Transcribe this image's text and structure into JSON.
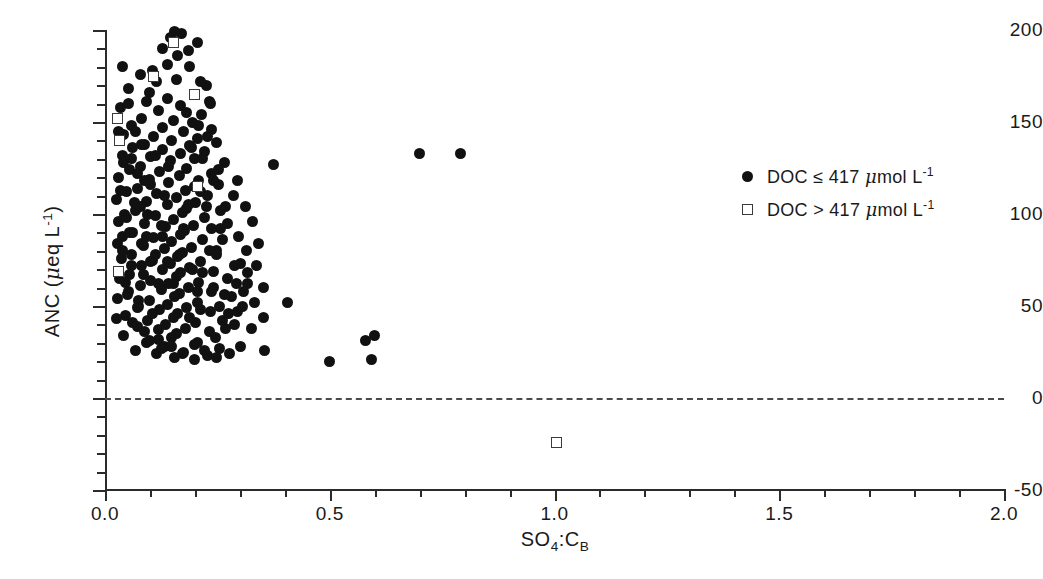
{
  "chart_data": {
    "type": "scatter",
    "title": "",
    "xlabel": "SO4:CB",
    "ylabel": "ANC (ueq L-1)",
    "xlim": [
      0.0,
      2.0
    ],
    "ylim": [
      -50,
      200
    ],
    "grid": false,
    "legend_position": "right",
    "xticks": [
      0.0,
      0.5,
      1.0,
      1.5,
      2.0
    ],
    "xtick_labels": [
      "0.0",
      "0.5",
      "1.0",
      "1.5",
      "2.0"
    ],
    "x_minor_step": 0.1,
    "yticks": [
      -50,
      0,
      50,
      100,
      150,
      200
    ],
    "ytick_labels": [
      "-50",
      "0",
      "50",
      "100",
      "150",
      "200"
    ],
    "y_minor_step": 10,
    "annotations": [
      {
        "name": "zero-reference-line",
        "type": "hline",
        "y": 0,
        "style": "dashed"
      }
    ],
    "series": [
      {
        "name": "DOC <= 417 umol L-1",
        "marker": "filled-circle",
        "color": "#111111",
        "points": [
          [
            0.155,
            199
          ],
          [
            0.17,
            198
          ],
          [
            0.145,
            196
          ],
          [
            0.205,
            193
          ],
          [
            0.128,
            190
          ],
          [
            0.185,
            189
          ],
          [
            0.04,
            180
          ],
          [
            0.105,
            178
          ],
          [
            0.078,
            176
          ],
          [
            0.16,
            173
          ],
          [
            0.225,
            170
          ],
          [
            0.052,
            168
          ],
          [
            0.098,
            166
          ],
          [
            0.2,
            165
          ],
          [
            0.14,
            163
          ],
          [
            0.232,
            161
          ],
          [
            0.168,
            159
          ],
          [
            0.035,
            158
          ],
          [
            0.118,
            156
          ],
          [
            0.215,
            154
          ],
          [
            0.082,
            152
          ],
          [
            0.152,
            151
          ],
          [
            0.195,
            150
          ],
          [
            0.06,
            148
          ],
          [
            0.128,
            147
          ],
          [
            0.238,
            146
          ],
          [
            0.175,
            145
          ],
          [
            0.042,
            143
          ],
          [
            0.108,
            142
          ],
          [
            0.205,
            141
          ],
          [
            0.148,
            140
          ],
          [
            0.248,
            139
          ],
          [
            0.088,
            138
          ],
          [
            0.188,
            137
          ],
          [
            0.062,
            136
          ],
          [
            0.128,
            135
          ],
          [
            0.222,
            134
          ],
          [
            0.168,
            133
          ],
          [
            0.7,
            133
          ],
          [
            0.79,
            133
          ],
          [
            0.038,
            132
          ],
          [
            0.102,
            131
          ],
          [
            0.198,
            130
          ],
          [
            0.145,
            129
          ],
          [
            0.265,
            128
          ],
          [
            0.375,
            127
          ],
          [
            0.078,
            126
          ],
          [
            0.182,
            125
          ],
          [
            0.055,
            124
          ],
          [
            0.122,
            123
          ],
          [
            0.238,
            122
          ],
          [
            0.165,
            121
          ],
          [
            0.03,
            120
          ],
          [
            0.098,
            119
          ],
          [
            0.208,
            118
          ],
          [
            0.142,
            117
          ],
          [
            0.252,
            116
          ],
          [
            0.198,
            115
          ],
          [
            0.072,
            114
          ],
          [
            0.178,
            113
          ],
          [
            0.048,
            112
          ],
          [
            0.115,
            111
          ],
          [
            0.228,
            110
          ],
          [
            0.158,
            109
          ],
          [
            0.025,
            108
          ],
          [
            0.092,
            107
          ],
          [
            0.202,
            106
          ],
          [
            0.138,
            105
          ],
          [
            0.268,
            104
          ],
          [
            0.182,
            103
          ],
          [
            0.068,
            102
          ],
          [
            0.172,
            101
          ],
          [
            0.044,
            100
          ],
          [
            0.112,
            99
          ],
          [
            0.222,
            98
          ],
          [
            0.152,
            97
          ],
          [
            0.03,
            96
          ],
          [
            0.088,
            95
          ],
          [
            0.196,
            94
          ],
          [
            0.135,
            93
          ],
          [
            0.258,
            92
          ],
          [
            0.176,
            91
          ],
          [
            0.062,
            90
          ],
          [
            0.168,
            89
          ],
          [
            0.04,
            88
          ],
          [
            0.108,
            87
          ],
          [
            0.218,
            86
          ],
          [
            0.148,
            85
          ],
          [
            0.028,
            84
          ],
          [
            0.085,
            83
          ],
          [
            0.192,
            82
          ],
          [
            0.132,
            81
          ],
          [
            0.248,
            80
          ],
          [
            0.172,
            79
          ],
          [
            0.058,
            78
          ],
          [
            0.162,
            77
          ],
          [
            0.036,
            76
          ],
          [
            0.105,
            75
          ],
          [
            0.212,
            74
          ],
          [
            0.145,
            73
          ],
          [
            0.302,
            73
          ],
          [
            0.082,
            72
          ],
          [
            0.188,
            71
          ],
          [
            0.128,
            70
          ],
          [
            0.242,
            69
          ],
          [
            0.168,
            68
          ],
          [
            0.054,
            67
          ],
          [
            0.158,
            66
          ],
          [
            0.032,
            65
          ],
          [
            0.102,
            64
          ],
          [
            0.208,
            63
          ],
          [
            0.142,
            62
          ],
          [
            0.318,
            62
          ],
          [
            0.078,
            61
          ],
          [
            0.185,
            60
          ],
          [
            0.352,
            60
          ],
          [
            0.125,
            59
          ],
          [
            0.238,
            58
          ],
          [
            0.165,
            57
          ],
          [
            0.05,
            56
          ],
          [
            0.155,
            55
          ],
          [
            0.028,
            54
          ],
          [
            0.098,
            53
          ],
          [
            0.205,
            52
          ],
          [
            0.138,
            51
          ],
          [
            0.405,
            52
          ],
          [
            0.075,
            50
          ],
          [
            0.182,
            49
          ],
          [
            0.122,
            48
          ],
          [
            0.235,
            47
          ],
          [
            0.162,
            46
          ],
          [
            0.046,
            45
          ],
          [
            0.152,
            44
          ],
          [
            0.026,
            43
          ],
          [
            0.095,
            42
          ],
          [
            0.202,
            41
          ],
          [
            0.135,
            40
          ],
          [
            0.072,
            39
          ],
          [
            0.178,
            38
          ],
          [
            0.118,
            37
          ],
          [
            0.232,
            36
          ],
          [
            0.158,
            35
          ],
          [
            0.042,
            34
          ],
          [
            0.148,
            33
          ],
          [
            0.6,
            34
          ],
          [
            0.58,
            31
          ],
          [
            0.092,
            30
          ],
          [
            0.198,
            29
          ],
          [
            0.132,
            28
          ],
          [
            0.255,
            27
          ],
          [
            0.068,
            26
          ],
          [
            0.175,
            25
          ],
          [
            0.355,
            26
          ],
          [
            0.115,
            24
          ],
          [
            0.228,
            23
          ],
          [
            0.155,
            22
          ],
          [
            0.5,
            20
          ],
          [
            0.592,
            21
          ],
          [
            0.212,
            48
          ],
          [
            0.188,
            44
          ],
          [
            0.262,
            42
          ],
          [
            0.295,
            47
          ],
          [
            0.282,
            55
          ],
          [
            0.308,
            58
          ],
          [
            0.272,
            65
          ],
          [
            0.288,
            72
          ],
          [
            0.315,
            80
          ],
          [
            0.298,
            88
          ],
          [
            0.272,
            95
          ],
          [
            0.258,
            102
          ],
          [
            0.285,
            110
          ],
          [
            0.242,
            118
          ],
          [
            0.318,
            68
          ],
          [
            0.332,
            52
          ],
          [
            0.268,
            38
          ],
          [
            0.245,
            33
          ],
          [
            0.205,
            30
          ],
          [
            0.118,
            32
          ],
          [
            0.088,
            36
          ],
          [
            0.062,
            41
          ],
          [
            0.105,
            46
          ],
          [
            0.075,
            53
          ],
          [
            0.052,
            58
          ],
          [
            0.118,
            62
          ],
          [
            0.085,
            67
          ],
          [
            0.058,
            72
          ],
          [
            0.112,
            78
          ],
          [
            0.082,
            84
          ],
          [
            0.055,
            90
          ],
          [
            0.125,
            94
          ],
          [
            0.095,
            100
          ],
          [
            0.065,
            106
          ],
          [
            0.132,
            110
          ],
          [
            0.102,
            116
          ],
          [
            0.072,
            122
          ],
          [
            0.142,
            126
          ],
          [
            0.112,
            132
          ],
          [
            0.082,
            138
          ],
          [
            0.262,
            86
          ],
          [
            0.248,
            78
          ],
          [
            0.238,
            92
          ],
          [
            0.225,
            104
          ],
          [
            0.212,
            112
          ],
          [
            0.252,
            124
          ],
          [
            0.218,
            130
          ],
          [
            0.192,
            136
          ],
          [
            0.228,
            142
          ],
          [
            0.208,
            148
          ],
          [
            0.182,
            155
          ],
          [
            0.235,
            160
          ],
          [
            0.212,
            172
          ],
          [
            0.188,
            180
          ],
          [
            0.162,
            186
          ],
          [
            0.138,
            181
          ],
          [
            0.115,
            172
          ],
          [
            0.092,
            161
          ],
          [
            0.328,
            96
          ],
          [
            0.342,
            84
          ],
          [
            0.312,
            104
          ],
          [
            0.295,
            118
          ],
          [
            0.338,
            72
          ],
          [
            0.352,
            44
          ],
          [
            0.325,
            38
          ],
          [
            0.302,
            28
          ],
          [
            0.278,
            24
          ],
          [
            0.248,
            22
          ],
          [
            0.222,
            26
          ],
          [
            0.198,
            21
          ],
          [
            0.172,
            24
          ],
          [
            0.148,
            28
          ],
          [
            0.125,
            27
          ],
          [
            0.098,
            31
          ],
          [
            0.072,
            49
          ],
          [
            0.045,
            63
          ],
          [
            0.038,
            80
          ],
          [
            0.048,
            98
          ],
          [
            0.035,
            113
          ],
          [
            0.042,
            128
          ],
          [
            0.03,
            145
          ],
          [
            0.052,
            160
          ],
          [
            0.068,
            145
          ],
          [
            0.058,
            130
          ],
          [
            0.088,
            118
          ],
          [
            0.078,
            104
          ],
          [
            0.092,
            88
          ],
          [
            0.102,
            74
          ],
          [
            0.128,
            88
          ],
          [
            0.138,
            74
          ],
          [
            0.152,
            62
          ],
          [
            0.165,
            78
          ],
          [
            0.175,
            92
          ],
          [
            0.185,
            105
          ],
          [
            0.195,
            70
          ],
          [
            0.205,
            58
          ],
          [
            0.218,
            68
          ],
          [
            0.232,
            80
          ],
          [
            0.242,
            60
          ],
          [
            0.255,
            50
          ],
          [
            0.265,
            56
          ],
          [
            0.275,
            46
          ],
          [
            0.288,
            40
          ],
          [
            0.292,
            62
          ],
          [
            0.305,
            50
          ]
        ]
      },
      {
        "name": "DOC > 417 umol L-1",
        "marker": "open-square",
        "color": "#3a3a3a",
        "points": [
          [
            0.152,
            193
          ],
          [
            0.108,
            175
          ],
          [
            0.2,
            165
          ],
          [
            0.028,
            152
          ],
          [
            0.032,
            140
          ],
          [
            0.205,
            115
          ],
          [
            0.03,
            69
          ],
          [
            1.005,
            -24
          ]
        ]
      }
    ],
    "legend": [
      {
        "marker": "filled-circle",
        "label": "DOC ≤ 417 μmol L⁻¹"
      },
      {
        "marker": "open-square",
        "label": "DOC > 417 μmol L⁻¹"
      }
    ]
  },
  "axes": {
    "y_title_prefix": "ANC (",
    "y_title_mu": "μ",
    "y_title_mid": "eq L",
    "y_title_sup": "-1",
    "y_title_suffix": ")",
    "x_title_main": "SO",
    "x_title_sub1": "4",
    "x_title_colon": ":C",
    "x_title_sub2": "B"
  },
  "legend_text": {
    "row1_prefix": "DOC ≤ 417 ",
    "row1_mu": "μ",
    "row1_unit": "mol L",
    "row1_sup": "-1",
    "row2_prefix": "DOC > 417 ",
    "row2_mu": "μ",
    "row2_unit": "mol L",
    "row2_sup": "-1"
  }
}
